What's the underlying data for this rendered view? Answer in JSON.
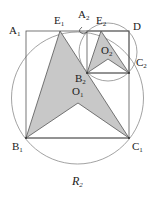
{
  "figure": {
    "caption": "R",
    "caption_sub": "2",
    "colors": {
      "stroke": "#555555",
      "circle": "#8a8a8a",
      "fill": "#c8c8c8",
      "text": "#222222"
    },
    "labels": {
      "A1": {
        "main": "A",
        "sub": "1"
      },
      "E1": {
        "main": "E",
        "sub": "1"
      },
      "A2": {
        "main": "A",
        "sub": "2"
      },
      "E2": {
        "main": "E",
        "sub": "2"
      },
      "D": {
        "main": "D",
        "sub": ""
      },
      "O2": {
        "main": "O",
        "sub": "2"
      },
      "C2": {
        "main": "C",
        "sub": "2"
      },
      "B2": {
        "main": "B",
        "sub": "2"
      },
      "O1": {
        "main": "O",
        "sub": "1"
      },
      "B1": {
        "main": "B",
        "sub": "1"
      },
      "C1": {
        "main": "C",
        "sub": "1"
      }
    }
  }
}
